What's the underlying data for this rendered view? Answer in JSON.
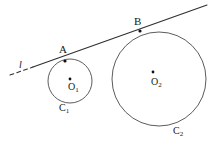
{
  "figure": {
    "kind": "geometry-diagram",
    "background_color": "#ffffff",
    "stroke_color": "#4a4a4a",
    "line_color": "#2e2e2e",
    "point_color": "#111111",
    "width": 214,
    "height": 153
  },
  "labels": {
    "point_a": "A",
    "point_b": "B",
    "center_o1_base": "O",
    "center_o1_sub": "1",
    "center_o2_base": "O",
    "center_o2_sub": "2",
    "circle_c1_base": "C",
    "circle_c1_sub": "1",
    "circle_c2_base": "C",
    "circle_c2_sub": "2",
    "line_l": "l"
  },
  "geometry": {
    "circle_small": {
      "name": "C1",
      "cx": 70,
      "cy": 81,
      "r": 22
    },
    "circle_large": {
      "name": "C2",
      "cx": 159,
      "cy": 79,
      "r": 47
    },
    "center_dot_o1": {
      "cx": 70,
      "cy": 79,
      "r": 1.4
    },
    "center_dot_o2": {
      "cx": 153,
      "cy": 72,
      "r": 1.4
    },
    "tangent_point_a": {
      "cx": 65,
      "cy": 61,
      "r": 1.6
    },
    "tangent_point_b": {
      "cx": 140,
      "cy": 31,
      "r": 1.6
    },
    "tangent_line_dashed": {
      "x1": 10,
      "y1": 75,
      "x2": 33,
      "y2": 67
    },
    "tangent_line_solid": {
      "x1": 33,
      "y1": 67,
      "x2": 207,
      "y2": 5
    }
  }
}
